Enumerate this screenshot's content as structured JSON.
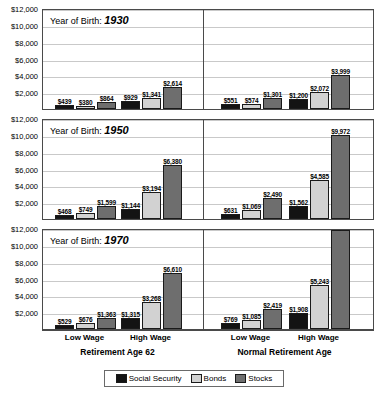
{
  "title": "",
  "axis": {
    "y_ticks": [
      "$12,000",
      "$10,000",
      "$8,000",
      "$6,000",
      "$4,000",
      "$2,000"
    ],
    "y_max": 12000,
    "y_min": 0,
    "y_step": 2000
  },
  "legend": {
    "items": [
      {
        "label": "Social Security",
        "color": "#131313",
        "key": "ss"
      },
      {
        "label": "Bonds",
        "color": "#d2d2d2",
        "key": "bd"
      },
      {
        "label": "Stocks",
        "color": "#6e6e6e",
        "key": "st"
      }
    ]
  },
  "xaxis": {
    "wage_labels": [
      "Low Wage",
      "High Wage",
      "Low Wage",
      "High Wage"
    ],
    "group_labels": [
      "Retirement Age 62",
      "Normal Retirement Age"
    ]
  },
  "panels": [
    {
      "prefix": "Year of Birth:",
      "year": "1930",
      "bars": [
        {
          "value": 439,
          "label": "$439",
          "series": "ss"
        },
        {
          "value": 380,
          "label": "$380",
          "series": "bd"
        },
        {
          "value": 864,
          "label": "$864",
          "series": "st"
        },
        {
          "value": 929,
          "label": "$929",
          "series": "ss"
        },
        {
          "value": 1341,
          "label": "$1,341",
          "series": "bd"
        },
        {
          "value": 2614,
          "label": "$2,614",
          "series": "st"
        },
        {
          "value": 551,
          "label": "$551",
          "series": "ss"
        },
        {
          "value": 574,
          "label": "$574",
          "series": "bd"
        },
        {
          "value": 1301,
          "label": "$1,301",
          "series": "st"
        },
        {
          "value": 1200,
          "label": "$1,200",
          "series": "ss"
        },
        {
          "value": 2072,
          "label": "$2,072",
          "series": "bd"
        },
        {
          "value": 3999,
          "label": "$3,999",
          "series": "st"
        }
      ]
    },
    {
      "prefix": "Year of Birth:",
      "year": "1950",
      "bars": [
        {
          "value": 468,
          "label": "$468",
          "series": "ss"
        },
        {
          "value": 749,
          "label": "$749",
          "series": "bd"
        },
        {
          "value": 1599,
          "label": "$1,599",
          "series": "st"
        },
        {
          "value": 1144,
          "label": "$1,144",
          "series": "ss"
        },
        {
          "value": 3194,
          "label": "$3,194",
          "series": "bd"
        },
        {
          "value": 6380,
          "label": "$6,380",
          "series": "st"
        },
        {
          "value": 631,
          "label": "$631",
          "series": "ss"
        },
        {
          "value": 1069,
          "label": "$1,069",
          "series": "bd"
        },
        {
          "value": 2490,
          "label": "$2,490",
          "series": "st"
        },
        {
          "value": 1562,
          "label": "$1,562",
          "series": "ss"
        },
        {
          "value": 4585,
          "label": "$4,585",
          "series": "bd"
        },
        {
          "value": 9972,
          "label": "$9,972",
          "series": "st"
        }
      ]
    },
    {
      "prefix": "Year of Birth:",
      "year": "1970",
      "bars": [
        {
          "value": 529,
          "label": "$529",
          "series": "ss"
        },
        {
          "value": 676,
          "label": "$676",
          "series": "bd"
        },
        {
          "value": 1363,
          "label": "$1,363",
          "series": "st"
        },
        {
          "value": 1315,
          "label": "$1,315",
          "series": "ss"
        },
        {
          "value": 3268,
          "label": "$3,268",
          "series": "bd"
        },
        {
          "value": 6610,
          "label": "$6,610",
          "series": "st"
        },
        {
          "value": 769,
          "label": "$769",
          "series": "ss"
        },
        {
          "value": 1085,
          "label": "$1,085",
          "series": "bd"
        },
        {
          "value": 2419,
          "label": "$2,419",
          "series": "st"
        },
        {
          "value": 1908,
          "label": "$1,908",
          "series": "ss"
        },
        {
          "value": 5243,
          "label": "$5,243",
          "series": "bd"
        },
        {
          "value": 11729,
          "label": "$11,729",
          "series": "st"
        }
      ]
    }
  ],
  "chart_data": {
    "type": "bar",
    "title": "",
    "xlabel": "",
    "ylabel": "",
    "ylim": [
      0,
      12000
    ],
    "ytick_values": [
      2000,
      4000,
      6000,
      8000,
      10000,
      12000
    ],
    "grid": true,
    "legend_position": "bottom",
    "panels": [
      "Year of Birth: 1930",
      "Year of Birth: 1950",
      "Year of Birth: 1970"
    ],
    "categories": [
      "Retirement Age 62 / Low Wage",
      "Retirement Age 62 / High Wage",
      "Normal Retirement Age / Low Wage",
      "Normal Retirement Age / High Wage"
    ],
    "series": [
      {
        "name": "Social Security",
        "values_by_panel": {
          "1930": [
            439,
            929,
            551,
            1200
          ],
          "1950": [
            468,
            1144,
            631,
            1562
          ],
          "1970": [
            529,
            1315,
            769,
            1908
          ]
        }
      },
      {
        "name": "Bonds",
        "values_by_panel": {
          "1930": [
            380,
            1341,
            574,
            2072
          ],
          "1950": [
            749,
            3194,
            1069,
            4585
          ],
          "1970": [
            676,
            3268,
            1085,
            5243
          ]
        }
      },
      {
        "name": "Stocks",
        "values_by_panel": {
          "1930": [
            864,
            2614,
            1301,
            3999
          ],
          "1950": [
            1599,
            6380,
            2490,
            9972
          ],
          "1970": [
            1363,
            6610,
            2419,
            11729
          ]
        }
      }
    ]
  }
}
